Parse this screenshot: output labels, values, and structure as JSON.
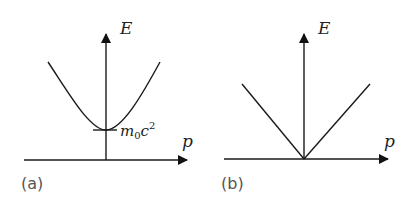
{
  "figure": {
    "panels": [
      {
        "id": "a",
        "label": "(a)",
        "y_axis_label": "E",
        "x_axis_label": "p",
        "curve": "hyperbola",
        "annotation": {
          "base": "m",
          "subscript": "0",
          "mid": "c",
          "superscript": "2"
        }
      },
      {
        "id": "b",
        "label": "(b)",
        "y_axis_label": "E",
        "x_axis_label": "p",
        "curve": "cone (V-shape)"
      }
    ]
  },
  "colors": {
    "line": "#1a1a1a",
    "label": "#555555",
    "background": "#ffffff"
  }
}
